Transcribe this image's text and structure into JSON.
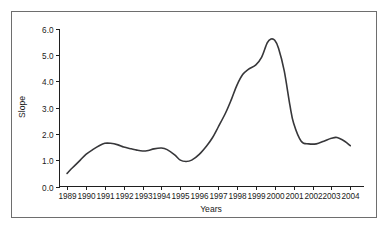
{
  "figure": {
    "background_color": "#ffffff",
    "border_color": "#6e6e6e",
    "line_color": "#37373a"
  },
  "chart_data": {
    "type": "line",
    "title": "",
    "xlabel": "Years",
    "ylabel": "Slope",
    "xlim": [
      1988.6,
      2004.7
    ],
    "ylim": [
      0.0,
      6.0
    ],
    "grid": false,
    "legend": null,
    "xtick_labels": [
      "1989",
      "1990",
      "1991",
      "1992",
      "1993",
      "1994",
      "1995",
      "1996",
      "1997",
      "1998",
      "1999",
      "2000",
      "2001",
      "2002",
      "2003",
      "2004"
    ],
    "ytick_labels": [
      "0.0",
      "1.0",
      "2.0",
      "3.0",
      "4.0",
      "5.0",
      "6.0"
    ],
    "xticks": [
      1989,
      1990,
      1991,
      1992,
      1993,
      1994,
      1995,
      1996,
      1997,
      1998,
      1999,
      2000,
      2001,
      2002,
      2003,
      2004
    ],
    "yticks": [
      0.0,
      1.0,
      2.0,
      3.0,
      4.0,
      5.0,
      6.0
    ],
    "series": [
      {
        "name": "Slope",
        "x": [
          1989.0,
          1989.3,
          1989.7,
          1990.0,
          1990.4,
          1990.7,
          1991.0,
          1991.3,
          1991.7,
          1992.0,
          1992.4,
          1992.7,
          1993.0,
          1993.3,
          1993.6,
          1994.0,
          1994.3,
          1994.7,
          1995.0,
          1995.3,
          1995.6,
          1996.0,
          1996.4,
          1996.7,
          1997.0,
          1997.4,
          1997.7,
          1998.0,
          1998.3,
          1998.6,
          1999.0,
          1999.3,
          1999.6,
          1999.8,
          2000.0,
          2000.2,
          2000.5,
          2000.8,
          2001.0,
          2001.4,
          2001.8,
          2002.2,
          2002.6,
          2003.0,
          2003.3,
          2003.7,
          2004.0
        ],
        "y": [
          0.5,
          0.72,
          1.0,
          1.22,
          1.42,
          1.55,
          1.64,
          1.64,
          1.58,
          1.5,
          1.43,
          1.38,
          1.35,
          1.37,
          1.43,
          1.46,
          1.4,
          1.2,
          1.0,
          0.95,
          1.0,
          1.22,
          1.55,
          1.85,
          2.25,
          2.8,
          3.3,
          3.85,
          4.25,
          4.45,
          4.62,
          4.9,
          5.45,
          5.6,
          5.55,
          5.25,
          4.4,
          3.1,
          2.4,
          1.72,
          1.62,
          1.62,
          1.72,
          1.83,
          1.86,
          1.72,
          1.55
        ]
      }
    ]
  }
}
